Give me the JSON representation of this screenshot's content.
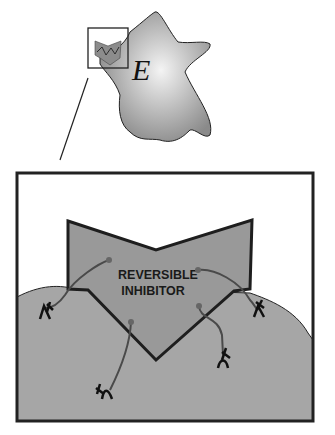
{
  "diagram": {
    "enzyme_label": "E",
    "inhibitor_label_line1": "REVERSIBLE",
    "inhibitor_label_line2": "INHIBITOR",
    "colors": {
      "enzyme_fill_center": "#f2f2f2",
      "enzyme_fill_edge": "#8a8a8a",
      "surface_fill": "#a6a6a6",
      "inhibitor_fill": "#999999",
      "outline": "#222222",
      "tether": "#4a4a4a"
    }
  }
}
